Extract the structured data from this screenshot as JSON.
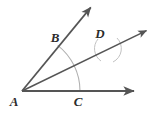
{
  "figure": {
    "kind": "geometry-diagram",
    "background_color": "#ffffff",
    "ray_color": "#555555",
    "arc_color": "#b0b0b0",
    "label_color": "#2b2b2b",
    "vertex": {
      "name": "A",
      "x": 22,
      "y": 91
    },
    "labels": [
      {
        "id": "A",
        "text": "A",
        "x": 14,
        "y": 101
      },
      {
        "id": "B",
        "text": "B",
        "x": 55,
        "y": 37
      },
      {
        "id": "C",
        "text": "C",
        "x": 78,
        "y": 101
      },
      {
        "id": "D",
        "text": "D",
        "x": 100,
        "y": 33
      }
    ],
    "rays": [
      {
        "id": "ray-AC",
        "label": "C",
        "from_x": 22,
        "from_y": 91,
        "to_x": 135,
        "to_y": 91,
        "arrowhead": true
      },
      {
        "id": "ray-AD",
        "label": "D",
        "from_x": 22,
        "from_y": 91,
        "to_x": 148,
        "to_y": 30,
        "arrowhead": true
      },
      {
        "id": "ray-AB",
        "label": "B",
        "from_x": 22,
        "from_y": 91,
        "to_x": 92,
        "to_y": 6,
        "arrowhead": true
      }
    ],
    "arcs": [
      {
        "id": "main-arc",
        "center_x": 22,
        "center_y": 91,
        "radius": 58,
        "start_deg": 0,
        "end_deg": 52
      },
      {
        "id": "cross-arc-1",
        "center_x": 22,
        "center_y": 91,
        "radius": 90,
        "start_deg": 19,
        "end_deg": 34
      },
      {
        "id": "cross-arc-2",
        "center_x": 108,
        "center_y": 48,
        "radius": 14,
        "start_deg": 200,
        "end_deg": 340
      }
    ],
    "intersections": [
      {
        "id": "point-B",
        "x": 58,
        "y": 47
      },
      {
        "id": "point-C",
        "x": 73,
        "y": 91
      },
      {
        "id": "point-D",
        "x": 108,
        "y": 48
      }
    ]
  }
}
